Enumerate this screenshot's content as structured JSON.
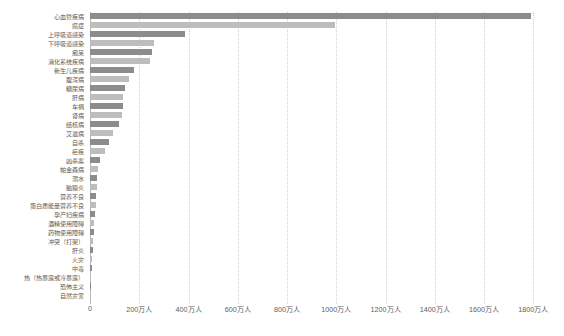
{
  "chart_data": {
    "type": "bar",
    "orientation": "horizontal",
    "title": "",
    "subtitle": "",
    "xlabel": "",
    "ylabel": "",
    "xlim": [
      0,
      1900
    ],
    "unit": "万人",
    "grid": "vertical-dotted",
    "legend": "none",
    "bar_colors": {
      "dark": "#8c8c8c",
      "light": "#bdbdbd"
    },
    "xticks": [
      0,
      200,
      400,
      600,
      800,
      1000,
      1200,
      1400,
      1600,
      1800
    ],
    "xtick_labels": [
      "0",
      "200万人",
      "400万人",
      "600万人",
      "800万人",
      "1000万人",
      "1200万人",
      "1400万人",
      "1600万人",
      "1800万人"
    ],
    "categories": [
      "心血管疾病",
      "癌症",
      "上呼吸道感染",
      "下呼吸道感染",
      "痴呆",
      "消化系统疾病",
      "新生儿疾病",
      "腹泻病",
      "糖尿病",
      "肝病",
      "车祸",
      "肾病",
      "结核病",
      "艾滋病",
      "自杀",
      "疟疾",
      "凶杀案",
      "帕金森病",
      "溺水",
      "脑膜炎",
      "营养不良",
      "蛋白质能量营养不良",
      "孕产妇疾病",
      "酒精使用障碍",
      "药物使用障碍",
      "冲突（打架）",
      "肝炎",
      "火灾",
      "中毒",
      "热（热暴露或冷暴露）",
      "恐怖主义",
      "自然灾害"
    ],
    "values": [
      1790,
      993,
      384,
      260,
      253,
      244,
      180,
      157,
      142,
      132,
      132,
      130,
      117,
      95,
      79,
      62,
      41,
      34,
      30,
      29,
      26,
      23,
      19,
      18,
      16,
      13,
      11,
      10,
      9,
      5,
      3,
      2
    ]
  }
}
